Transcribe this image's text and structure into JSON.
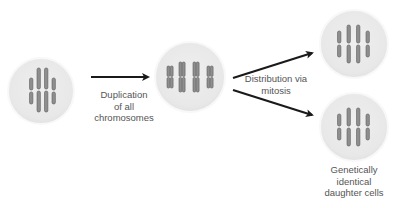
{
  "diagram": {
    "colors": {
      "cell_fill": "#ececec",
      "cell_border": "#f7f7f7",
      "chromosome_fill": "#8e8e8e",
      "chromosome_stroke": "#5e5e5e",
      "arrow": "#1a1a1a",
      "text": "#555555"
    },
    "cells": [
      {
        "id": "parent-cell",
        "state": "unreplicated chromosomes",
        "chromosome_count": 4
      },
      {
        "id": "duplicated-cell",
        "state": "duplicated chromosomes (sister chromatids)",
        "chromosome_count": 4
      },
      {
        "id": "daughter-cell-1",
        "state": "unreplicated chromosomes",
        "chromosome_count": 4
      },
      {
        "id": "daughter-cell-2",
        "state": "unreplicated chromosomes",
        "chromosome_count": 4
      }
    ],
    "labels": {
      "duplication": [
        "Duplication",
        "of all",
        "chromosomes"
      ],
      "distribution": [
        "Distribution via",
        "mitosis"
      ],
      "daughters": [
        "Genetically",
        "identical",
        "daughter cells"
      ]
    },
    "arrows": [
      {
        "from": "parent-cell",
        "to": "duplicated-cell",
        "label": "duplication"
      },
      {
        "from": "duplicated-cell",
        "to": "daughter-cell-1",
        "label": "distribution"
      },
      {
        "from": "duplicated-cell",
        "to": "daughter-cell-2",
        "label": "distribution"
      }
    ]
  }
}
